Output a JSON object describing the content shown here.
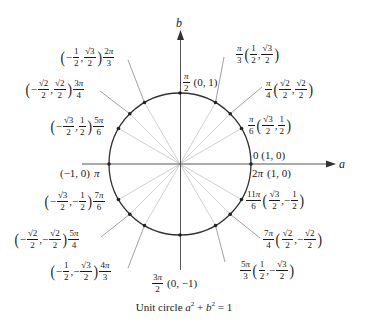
{
  "diagram": {
    "title": "Unit circle",
    "equation": "a² + b² = 1",
    "caption_prefix": "Unit circle",
    "caption_a": "a",
    "caption_a_exp": "2",
    "caption_plus": "+",
    "caption_b": "b",
    "caption_b_exp": "2",
    "caption_eq": "= 1",
    "axes": {
      "horizontal": "a",
      "vertical": "b"
    },
    "colors": {
      "circle": "#333333",
      "axis": "#555555",
      "ray": "#bbbbbb",
      "text": "#1a1a1a"
    },
    "points": [
      {
        "angle": "0",
        "coords": "(1, 0)"
      },
      {
        "angle": "π/6",
        "coords": "(√3/2, 1/2)"
      },
      {
        "angle": "π/4",
        "coords": "(√2/2, √2/2)"
      },
      {
        "angle": "π/3",
        "coords": "(1/2, √3/2)"
      },
      {
        "angle": "π/2",
        "coords": "(0, 1)"
      },
      {
        "angle": "2π/3",
        "coords": "(−1/2, √3/2)"
      },
      {
        "angle": "3π/4",
        "coords": "(−√2/2, √2/2)"
      },
      {
        "angle": "5π/6",
        "coords": "(−√3/2, 1/2)"
      },
      {
        "angle": "π",
        "coords": "(−1, 0)"
      },
      {
        "angle": "7π/6",
        "coords": "(−√3/2, −1/2)"
      },
      {
        "angle": "5π/4",
        "coords": "(−√2/2, −√2/2)"
      },
      {
        "angle": "4π/3",
        "coords": "(−1/2, −√3/2)"
      },
      {
        "angle": "3π/2",
        "coords": "(0, −1)"
      },
      {
        "angle": "5π/3",
        "coords": "(1/2, −√3/2)"
      },
      {
        "angle": "7π/4",
        "coords": "(√2/2, −√2/2)"
      },
      {
        "angle": "11π/6",
        "coords": "(√3/2, −1/2)"
      },
      {
        "angle": "2π",
        "coords": "(1, 0)"
      }
    ],
    "text": {
      "lp": "(",
      "rp": ")",
      "comma": ",",
      "minus": "−",
      "pi": "π",
      "one": "1",
      "two": "2",
      "three": "3",
      "four": "4",
      "five": "5",
      "six": "6",
      "seven": "7",
      "eleven": "11",
      "sqrt3": "√3",
      "sqrt2": "√2",
      "zero_label": "0 (1, 0)",
      "twopi_label": "(1, 0)",
      "pi_coords": "(−1, 0)",
      "half_pi_coords": "(0, 1)",
      "three_half_pi_coords": "(0, −1)"
    }
  }
}
